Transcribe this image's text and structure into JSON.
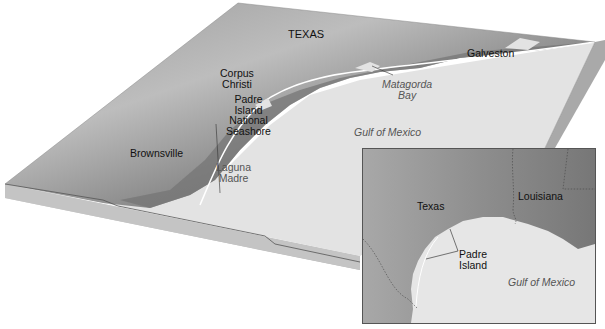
{
  "main_map": {
    "state_label": "TEXAS",
    "cities": [
      {
        "name": "Corpus",
        "name2": "Christi"
      },
      {
        "name": "Brownsville"
      },
      {
        "name": "Galveston"
      }
    ],
    "features": {
      "padre_island": [
        "Padre",
        "Island",
        "National",
        "Seashore"
      ],
      "laguna_madre": [
        "Laguna",
        "Madre"
      ],
      "matagorda_bay": [
        "Matagorda",
        "Bay"
      ]
    },
    "water_label": "Gulf of Mexico"
  },
  "inset_map": {
    "labels": {
      "texas": "Texas",
      "louisiana": "Louisiana",
      "padre": [
        "Padre",
        "Island"
      ],
      "water": "Gulf of Mexico"
    }
  },
  "colors": {
    "land_dark": "#6e6e6e",
    "land_light": "#b5b5b5",
    "water": "#e4e4e4",
    "block_side": "#bdbdbd",
    "border": "#555555"
  }
}
